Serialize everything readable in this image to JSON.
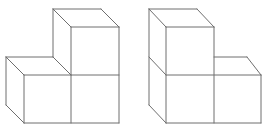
{
  "figures": [
    {
      "name": "left-cube-arrangement",
      "description": "Three unit cubes: two on the bottom row, one stacked on top of the right cube",
      "edges": [
        [
          53,
          9,
          101,
          9
        ],
        [
          53,
          9,
          71,
          27
        ],
        [
          101,
          9,
          119,
          27
        ],
        [
          71,
          27,
          119,
          27
        ],
        [
          53,
          9,
          53,
          57
        ],
        [
          71,
          27,
          71,
          75
        ],
        [
          119,
          27,
          119,
          123
        ],
        [
          6,
          57,
          53,
          57
        ],
        [
          6,
          57,
          24,
          75
        ],
        [
          53,
          57,
          71,
          75
        ],
        [
          24,
          75,
          119,
          75
        ],
        [
          6,
          57,
          6,
          105
        ],
        [
          24,
          75,
          24,
          123
        ],
        [
          6,
          105,
          24,
          123
        ],
        [
          24,
          123,
          119,
          123
        ],
        [
          71,
          75,
          71,
          123
        ]
      ]
    },
    {
      "name": "right-cube-arrangement",
      "description": "Three unit cubes: two on the bottom row, one stacked on top of the left cube",
      "edges": [
        [
          149,
          9,
          197,
          9
        ],
        [
          149,
          9,
          166,
          27
        ],
        [
          197,
          9,
          214,
          27
        ],
        [
          166,
          27,
          214,
          27
        ],
        [
          149,
          9,
          149,
          105
        ],
        [
          166,
          27,
          166,
          123
        ],
        [
          214,
          27,
          214,
          123
        ],
        [
          149,
          57,
          166,
          75
        ],
        [
          214,
          57,
          247,
          57
        ],
        [
          247,
          57,
          261,
          75
        ],
        [
          166,
          75,
          261,
          75
        ],
        [
          261,
          75,
          261,
          123
        ],
        [
          149,
          105,
          166,
          123
        ],
        [
          166,
          123,
          261,
          123
        ]
      ]
    }
  ],
  "colors": {
    "stroke": "#6e6e6e",
    "background": "#ffffff"
  }
}
